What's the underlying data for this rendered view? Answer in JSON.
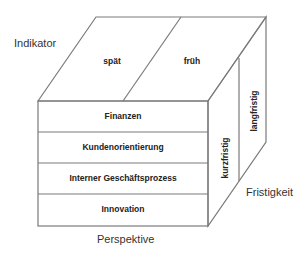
{
  "axes": {
    "indikator": "Indikator",
    "perspektive": "Perspektive",
    "fristigkeit": "Fristigkeit"
  },
  "top_face": {
    "cells": [
      "spät",
      "früh"
    ]
  },
  "front_face": {
    "rows": [
      "Finanzen",
      "Kundenorientierung",
      "Interner Geschäftsprozess",
      "Innovation"
    ]
  },
  "side_face": {
    "cells": [
      "kurzfristig",
      "langfristig"
    ]
  },
  "colors": {
    "stroke": "#7a7a7a",
    "text": "#222222"
  }
}
